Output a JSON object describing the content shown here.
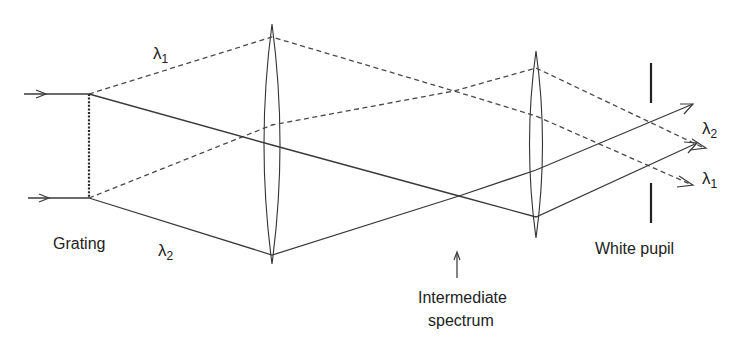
{
  "diagram": {
    "labels": {
      "grating": "Grating",
      "lambda1_top": "λ",
      "lambda1_top_sub": "1",
      "lambda2_bottom": "λ",
      "lambda2_bottom_sub": "2",
      "lambda2_out": "λ",
      "lambda2_out_sub": "2",
      "lambda1_out": "λ",
      "lambda1_out_sub": "1",
      "white_pupil": "White pupil",
      "intermediate_line1": "Intermediate",
      "intermediate_line2": "spectrum"
    },
    "components": [
      {
        "name": "grating",
        "x": 89,
        "y_top": 94,
        "y_bottom": 198,
        "style": "dotted"
      },
      {
        "name": "lens-1",
        "x": 272,
        "y_top": 24,
        "y_bottom": 264
      },
      {
        "name": "lens-2",
        "x": 536,
        "y_top": 51,
        "y_bottom": 238
      },
      {
        "name": "white-pupil-stop",
        "x": 651,
        "upper_bar": [
          63,
          103
        ],
        "lower_bar": [
          183,
          223
        ]
      }
    ],
    "rays": {
      "lambda1_dashed": [
        "input top→lens1 top→lens2→out λ1",
        "input bottom→lens1→lens2 top→out λ2"
      ],
      "lambda2_solid": [
        "grating top→lens1→lens2 bottom→out",
        "grating bottom→lens1 bottom→lens2→out"
      ]
    },
    "colors": {
      "line": "#3a3a3a",
      "text": "#222222",
      "background": "#ffffff"
    }
  }
}
